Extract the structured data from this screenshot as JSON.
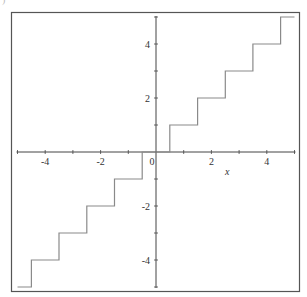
{
  "corner_label": ")",
  "chart_data": {
    "type": "line",
    "subtype": "step",
    "title": "",
    "function": "round(x)",
    "xlabel": "x",
    "ylabel": "",
    "xlim": [
      -5,
      5
    ],
    "ylim": [
      -5,
      5
    ],
    "x_ticks_major": [
      -4,
      -2,
      2,
      4
    ],
    "x_tick_labels": [
      "-4",
      "-2",
      "0",
      "2",
      "4"
    ],
    "y_ticks_major": [
      -4,
      -2,
      2,
      4
    ],
    "y_tick_labels": [
      "4",
      "2",
      "-2",
      "-4"
    ],
    "minor_ticks": [
      -5,
      -3,
      -1,
      1,
      3,
      5
    ],
    "origin_label": "0",
    "grid": false,
    "legend": null,
    "series": [
      {
        "name": "round(x)",
        "color": "#8a8a8a",
        "points": [
          [
            -5,
            -5
          ],
          [
            -4.5,
            -5
          ],
          [
            -4.5,
            -4
          ],
          [
            -3.5,
            -4
          ],
          [
            -3.5,
            -3
          ],
          [
            -2.5,
            -3
          ],
          [
            -2.5,
            -2
          ],
          [
            -1.5,
            -2
          ],
          [
            -1.5,
            -1
          ],
          [
            -0.5,
            -1
          ],
          [
            -0.5,
            0
          ],
          [
            0.5,
            0
          ],
          [
            0.5,
            1
          ],
          [
            1.5,
            1
          ],
          [
            1.5,
            2
          ],
          [
            2.5,
            2
          ],
          [
            2.5,
            3
          ],
          [
            3.5,
            3
          ],
          [
            3.5,
            4
          ],
          [
            4.5,
            4
          ],
          [
            4.5,
            5
          ],
          [
            5,
            5
          ]
        ]
      }
    ]
  },
  "style": {
    "frame_color": "#555555",
    "axis_color": "#444444",
    "tick_label_color": "#333333"
  }
}
